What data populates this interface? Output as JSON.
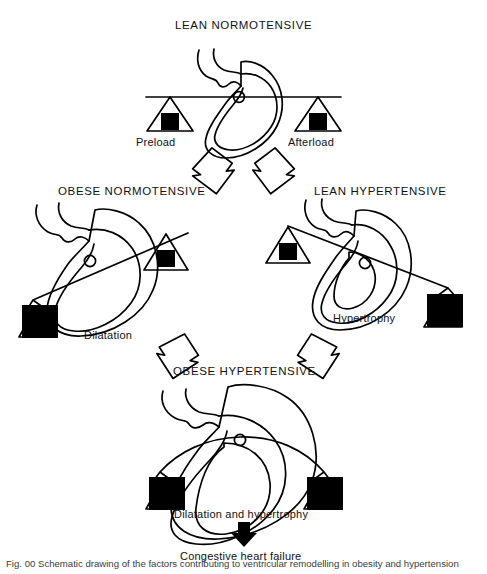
{
  "figure": {
    "type": "medical-concept-diagram",
    "background_color": "#ffffff",
    "ink_color": "#000000"
  },
  "stages": [
    {
      "id": "lean-normotensive",
      "title": "LEAN NORMOTENSIVE",
      "beam_state": "level",
      "left_load": {
        "label": "Preload",
        "size": "small"
      },
      "right_load": {
        "label": "Afterload",
        "size": "small"
      },
      "heart": "normal",
      "outcome": ""
    },
    {
      "id": "obese-normotensive",
      "title": "OBESE NORMOTENSIVE",
      "beam_state": "tilted-left",
      "left_load": {
        "label": "",
        "size": "large"
      },
      "right_load": {
        "label": "",
        "size": "small"
      },
      "heart": "dilated",
      "outcome": "Dilatation"
    },
    {
      "id": "lean-hypertensive",
      "title": "LEAN HYPERTENSIVE",
      "beam_state": "tilted-right",
      "left_load": {
        "label": "",
        "size": "small"
      },
      "right_load": {
        "label": "",
        "size": "large"
      },
      "heart": "hypertrophied",
      "outcome": "Hypertrophy"
    },
    {
      "id": "obese-hypertensive",
      "title": "OBESE HYPERTENSIVE",
      "beam_state": "sagging",
      "left_load": {
        "label": "",
        "size": "large"
      },
      "right_load": {
        "label": "",
        "size": "large"
      },
      "heart": "dilated-and-hypertrophied",
      "outcome": "Dilatation and hypertrophy"
    }
  ],
  "labels": {
    "preload": "Preload",
    "afterload": "Afterload",
    "dilatation": "Dilatation",
    "hypertrophy": "Hypertrophy",
    "dilatation_and_hypertrophy": "Dilatation and hypertrophy",
    "congestive_heart_failure": "Congestive heart failure"
  },
  "flow_arrows": [
    {
      "from": "lean-normotensive",
      "to": "obese-normotensive",
      "style": "hollow-block",
      "direction": "down-left"
    },
    {
      "from": "lean-normotensive",
      "to": "lean-hypertensive",
      "style": "hollow-block",
      "direction": "down-right"
    },
    {
      "from": "obese-normotensive",
      "to": "obese-hypertensive",
      "style": "hollow-block",
      "direction": "down-right"
    },
    {
      "from": "lean-hypertensive",
      "to": "obese-hypertensive",
      "style": "hollow-block",
      "direction": "down-left"
    },
    {
      "from": "obese-hypertensive",
      "to": "congestive-heart-failure",
      "style": "solid-filled",
      "direction": "down"
    }
  ],
  "caption": {
    "text": "Fig. 00 Schematic drawing of the factors contributing to ventricular remodelling in obesity and hypertension"
  }
}
